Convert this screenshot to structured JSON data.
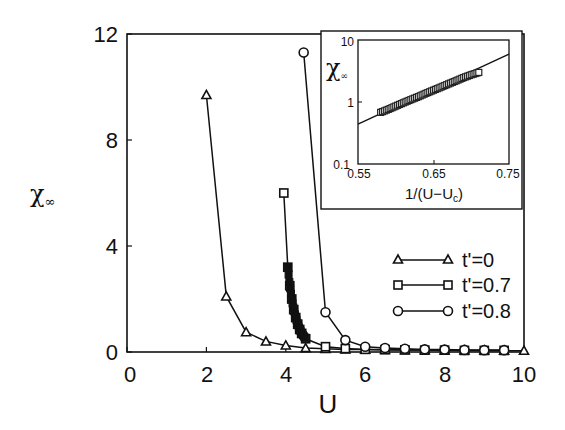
{
  "chart_data": [
    {
      "type": "line",
      "title": "",
      "xlabel": "U",
      "ylabel": "χ∞",
      "xlim": [
        0,
        10
      ],
      "ylim": [
        0,
        12
      ],
      "xticks": [
        0,
        2,
        4,
        6,
        8,
        10
      ],
      "yticks": [
        0,
        4,
        8,
        12
      ],
      "grid": false,
      "legend_position": "lower right (inside plot)",
      "series": [
        {
          "name": "t'=0",
          "marker": "triangle",
          "x": [
            2.0,
            2.5,
            3.0,
            3.5,
            4.0,
            4.5,
            5.0,
            5.5,
            6.0,
            6.5,
            7.0,
            7.5,
            8.0,
            8.5,
            9.0,
            9.5,
            10.0
          ],
          "y": [
            9.7,
            2.1,
            0.75,
            0.4,
            0.25,
            0.15,
            0.12,
            0.1,
            0.09,
            0.08,
            0.07,
            0.07,
            0.06,
            0.06,
            0.06,
            0.05,
            0.05
          ]
        },
        {
          "name": "t'=0.7",
          "marker": "square",
          "x": [
            3.95,
            4.05,
            4.1,
            4.15,
            4.2,
            4.25,
            4.3,
            4.35,
            4.4,
            4.5,
            5.0,
            5.5,
            6.0,
            6.5,
            7.0,
            7.5,
            8.0,
            8.5,
            9.0,
            9.5
          ],
          "y": [
            6.0,
            3.2,
            2.5,
            2.0,
            1.6,
            1.3,
            1.05,
            0.85,
            0.7,
            0.5,
            0.2,
            0.13,
            0.1,
            0.09,
            0.08,
            0.07,
            0.07,
            0.06,
            0.06,
            0.06
          ]
        },
        {
          "name": "t'=0.8",
          "marker": "circle",
          "x": [
            4.45,
            5.0,
            5.5,
            6.0,
            6.5,
            7.0,
            7.5,
            8.0,
            8.5,
            9.0,
            9.5
          ],
          "y": [
            11.3,
            1.5,
            0.45,
            0.2,
            0.15,
            0.12,
            0.1,
            0.09,
            0.08,
            0.07,
            0.07
          ]
        }
      ]
    },
    {
      "type": "scatter",
      "role": "inset",
      "title": "",
      "xlabel": "1/(U−Uc)",
      "ylabel": "χ∞",
      "xlim": [
        0.55,
        0.75
      ],
      "ylim": [
        0.1,
        10
      ],
      "yscale": "log",
      "xticks": [
        0.55,
        0.65,
        0.75
      ],
      "yticks": [
        0.1,
        1,
        10
      ],
      "grid": false,
      "fit_line": {
        "x": [
          0.55,
          0.75
        ],
        "y": [
          0.44,
          5.9
        ]
      },
      "series": [
        {
          "name": "t'=0.7",
          "marker": "square",
          "x": [
            0.58,
            0.59,
            0.6,
            0.61,
            0.62,
            0.63,
            0.64,
            0.65,
            0.66,
            0.67,
            0.68,
            0.69,
            0.7,
            0.71
          ],
          "y": [
            0.68,
            0.76,
            0.86,
            0.97,
            1.09,
            1.22,
            1.38,
            1.55,
            1.74,
            1.96,
            2.2,
            2.48,
            2.75,
            3.0
          ]
        }
      ]
    }
  ],
  "labels": {
    "x_axis": "U",
    "y_axis_main": "χ",
    "y_axis_sub": "∞",
    "main_xticks": [
      "0",
      "2",
      "4",
      "6",
      "8",
      "10"
    ],
    "main_yticks": [
      "0",
      "4",
      "8",
      "12"
    ],
    "legend": [
      "t'=0",
      "t'=0.7",
      "t'=0.8"
    ],
    "inset_x_axis_main": "1/(U−U",
    "inset_x_axis_sub": "c",
    "inset_x_axis_close": ")",
    "inset_y_axis_main": "χ",
    "inset_y_axis_sub": "∞",
    "inset_xticks": [
      "0.55",
      "0.65",
      "0.75"
    ],
    "inset_yticks": [
      "0.1",
      "1",
      "10"
    ]
  },
  "colors": {
    "ink": "#111111",
    "background": "#ffffff"
  }
}
